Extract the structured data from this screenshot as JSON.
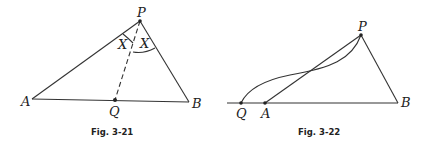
{
  "figures": [
    {
      "id": "fig-3-21",
      "caption": "Fig. 3-21",
      "points": {
        "A": "A",
        "B": "B",
        "P": "P",
        "Q": "Q"
      },
      "angle_labels": [
        "X",
        "X"
      ]
    },
    {
      "id": "fig-3-22",
      "caption": "Fig. 3-22",
      "points": {
        "P": "P",
        "Q": "Q",
        "A": "A",
        "B": "B"
      }
    }
  ]
}
